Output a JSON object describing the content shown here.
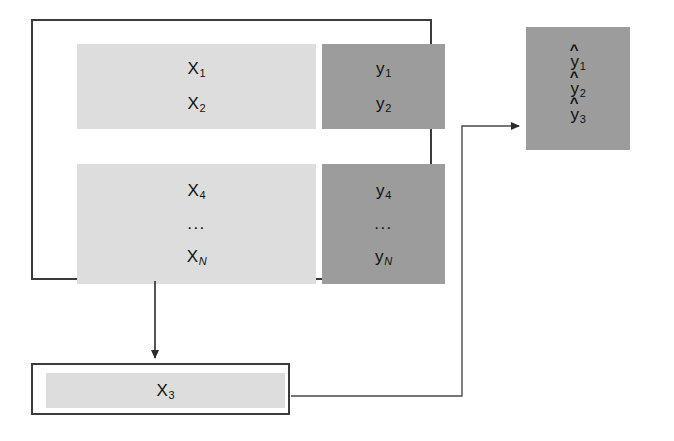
{
  "diagram": {
    "background_color": "#ffffff",
    "line_color": "#3b3b3b",
    "colors": {
      "features_block": "#dddddd",
      "targets_block": "#9c9c9c",
      "predictions_block": "#9c9c9c",
      "border": "#3b3b3b",
      "text": "#111111"
    },
    "training_set": {
      "features_top": {
        "items": [
          {
            "base": "X",
            "sub": "1",
            "italic_sub": false
          },
          {
            "base": "X",
            "sub": "2",
            "italic_sub": false
          }
        ]
      },
      "targets_top": {
        "items": [
          {
            "base": "y",
            "sub": "1",
            "italic_sub": false
          },
          {
            "base": "y",
            "sub": "2",
            "italic_sub": false
          }
        ]
      },
      "features_bottom": {
        "items": [
          {
            "base": "X",
            "sub": "4",
            "italic_sub": false
          }
        ],
        "ellipsis": "...",
        "last": {
          "base": "X",
          "sub": "N",
          "italic_sub": true
        }
      },
      "targets_bottom": {
        "items": [
          {
            "base": "y",
            "sub": "4",
            "italic_sub": false
          }
        ],
        "ellipsis": "...",
        "last": {
          "base": "y",
          "sub": "N",
          "italic_sub": true
        }
      }
    },
    "holdout": {
      "label": {
        "base": "X",
        "sub": "3",
        "italic_sub": false
      }
    },
    "predictions": {
      "hat": "^",
      "items": [
        {
          "base": "y",
          "sub": "1",
          "italic_sub": false
        },
        {
          "base": "y",
          "sub": "2",
          "italic_sub": false
        },
        {
          "base": "y",
          "sub": "3",
          "italic_sub": false
        }
      ]
    },
    "arrows": [
      {
        "name": "training-to-holdout",
        "direction": "down"
      },
      {
        "name": "holdout-to-predictions",
        "direction": "right"
      }
    ]
  }
}
